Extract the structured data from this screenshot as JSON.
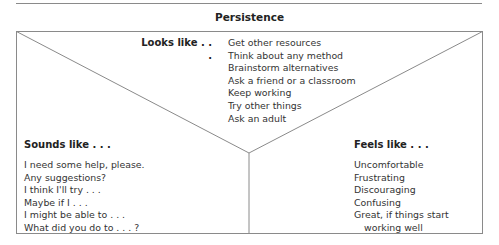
{
  "title": "Persistence",
  "sections": {
    "looks_like": {
      "heading": "Looks like . . .",
      "items": [
        "Get other resources",
        "Think about any method",
        "Brainstorm alternatives",
        "Ask a friend or a classroom",
        "Keep working",
        "Try other things",
        "Ask an adult"
      ]
    },
    "sounds_like": {
      "heading": "Sounds like . . .",
      "items": [
        "I need some help, please.",
        "Any suggestions?",
        "I think I'll try . . .",
        "Maybe if I . . .",
        "I might be able to . . .",
        "What did you do to . . . ?"
      ]
    },
    "feels_like": {
      "heading": "Feels like . . .",
      "items": [
        "Uncomfortable",
        "Frustrating",
        "Discouraging",
        "Confusing",
        "Great, if things start",
        "working well"
      ]
    }
  },
  "colors": {
    "line": "#8a8a8a",
    "text": "#333333"
  }
}
